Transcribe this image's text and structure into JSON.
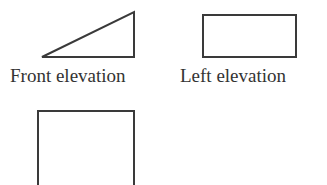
{
  "diagram": {
    "stroke_color": "#3a3a3a",
    "views": [
      {
        "name": "Front elevation",
        "shape": "right-triangle",
        "points": [
          [
            42,
            57
          ],
          [
            134,
            12
          ],
          [
            134,
            57
          ]
        ]
      },
      {
        "name": "Left elevation",
        "shape": "rectangle",
        "x": 203,
        "y": 15,
        "width": 93,
        "height": 42
      },
      {
        "name": "Top view (unlabeled)",
        "shape": "rectangle-partial",
        "x": 38,
        "y": 111,
        "width": 96,
        "height": 74
      }
    ]
  },
  "labels": {
    "front": "Front elevation",
    "left": "Left elevation"
  }
}
